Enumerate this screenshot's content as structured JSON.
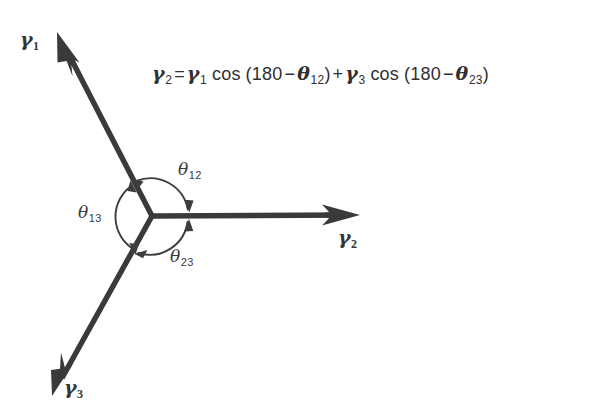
{
  "figure": {
    "background_color": "#ffffff",
    "stroke_color": "#3a3a3a",
    "text_color": "#343434",
    "width": 602,
    "height": 415
  },
  "equation": {
    "full_text": "γ₂ = γ₁ cos (180 − θ₁₂) + γ₃ cos (180 − θ₂₃)",
    "lhs_symbol": "γ",
    "lhs_sub": "2",
    "equals": "=",
    "term1_symbol": "γ",
    "term1_sub": "1",
    "cos1": "cos",
    "open1": "(",
    "deg1": "180",
    "minus1": "−",
    "theta1_symbol": "θ",
    "theta1_sub": "12",
    "close1": ")",
    "plus": "+",
    "term2_symbol": "γ",
    "term2_sub": "3",
    "cos2": "cos",
    "open2": "(",
    "deg2": "180",
    "minus2": "−",
    "theta2_symbol": "θ",
    "theta2_sub": "23",
    "close2": ")"
  },
  "vectors": [
    {
      "id": "gamma-1",
      "symbol": "γ",
      "subscript": "1",
      "label_text": "γ₁",
      "origin": [
        152,
        216
      ],
      "tip": [
        57,
        32
      ],
      "angle_deg": 117.3,
      "label_pos": [
        20,
        30
      ]
    },
    {
      "id": "gamma-2",
      "symbol": "γ",
      "subscript": "2",
      "label_text": "γ₂",
      "origin": [
        152,
        216
      ],
      "tip": [
        360,
        215
      ],
      "angle_deg": 0.3,
      "label_pos": [
        338,
        228
      ]
    },
    {
      "id": "gamma-3",
      "symbol": "γ",
      "subscript": "3",
      "label_text": "γ₃",
      "origin": [
        152,
        216
      ],
      "tip": [
        52,
        396
      ],
      "angle_deg": -119.0,
      "label_pos": [
        64,
        378
      ]
    }
  ],
  "angles": [
    {
      "id": "theta-12",
      "symbol": "θ",
      "subscript": "12",
      "label_text": "θ₁₂",
      "between": [
        "gamma-1",
        "gamma-2"
      ],
      "arc_radius": 38,
      "start_deg": 0,
      "end_deg": 117,
      "label_pos": [
        178,
        161
      ]
    },
    {
      "id": "theta-13",
      "symbol": "θ",
      "subscript": "13",
      "label_text": "θ₁₃",
      "between": [
        "gamma-1",
        "gamma-3"
      ],
      "arc_radius": 38,
      "start_deg": 117,
      "end_deg": 241,
      "label_pos": [
        78,
        204
      ]
    },
    {
      "id": "theta-23",
      "symbol": "θ",
      "subscript": "23",
      "label_text": "θ₂₃",
      "between": [
        "gamma-2",
        "gamma-3"
      ],
      "arc_radius": 38,
      "start_deg": 241,
      "end_deg": 360,
      "label_pos": [
        170,
        248
      ]
    }
  ]
}
